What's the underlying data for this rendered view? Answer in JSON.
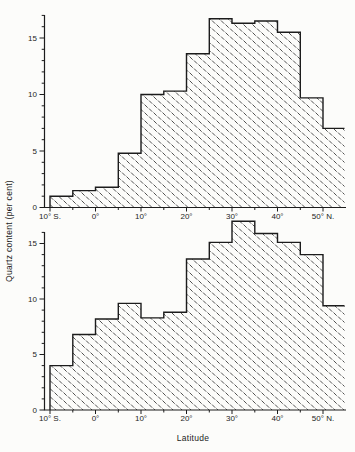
{
  "figure": {
    "ylabel": "Quartz content (per cent)",
    "xlabel": "Latitude",
    "ink_color": "#1c1c1c",
    "hatch_color": "#3d3d3d",
    "background": "#fcfcfa"
  },
  "chart_data": [
    {
      "id": "upper",
      "type": "bar",
      "subtype": "step-histogram-hatched",
      "ylabel": "Quartz content (per cent)",
      "xlabel": "",
      "bin_edges_deg_north": [
        -10,
        -5,
        0,
        5,
        10,
        15,
        20,
        25,
        30,
        35,
        40,
        45,
        50,
        55
      ],
      "values_percent": [
        1.0,
        1.5,
        1.8,
        4.8,
        10.0,
        10.3,
        13.6,
        16.7,
        16.3,
        16.5,
        15.5,
        9.7,
        7.0
      ],
      "x_tick_deg": [
        -10,
        0,
        10,
        20,
        30,
        40,
        50
      ],
      "x_tick_labels": [
        "10° S.",
        "0°",
        "10°",
        "20°",
        "30°",
        "40°",
        "50° N."
      ],
      "y_tick_values": [
        0,
        5,
        10,
        15
      ],
      "y_tick_labels": [
        "0",
        "5",
        "10",
        "15"
      ],
      "ylim": [
        0,
        17
      ],
      "xlim_deg": [
        -11.2,
        55
      ],
      "grid": false,
      "legend": false
    },
    {
      "id": "lower",
      "type": "bar",
      "subtype": "step-histogram-hatched",
      "ylabel": "Quartz content (per cent)",
      "xlabel": "Latitude",
      "bin_edges_deg_north": [
        -10,
        -5,
        0,
        5,
        10,
        15,
        20,
        25,
        30,
        35,
        40,
        45,
        50,
        55
      ],
      "values_percent": [
        4.0,
        6.8,
        8.2,
        9.6,
        8.3,
        8.8,
        13.6,
        15.1,
        17.0,
        15.9,
        15.1,
        14.0,
        9.4
      ],
      "x_tick_deg": [
        -10,
        0,
        10,
        20,
        30,
        40,
        50
      ],
      "x_tick_labels": [
        "10° S.",
        "0°",
        "10°",
        "20°",
        "30°",
        "40°",
        "50° N."
      ],
      "y_tick_values": [
        0,
        5,
        10,
        15
      ],
      "y_tick_labels": [
        "0",
        "5",
        "10",
        "15"
      ],
      "ylim": [
        0,
        16
      ],
      "xlim_deg": [
        -11.2,
        55
      ],
      "grid": false,
      "legend": false
    }
  ]
}
